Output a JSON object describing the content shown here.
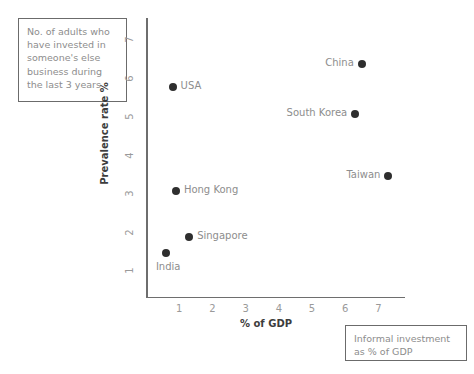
{
  "callouts": {
    "prevalence": "No. of adults who have invested in someone's else business during the last 3 years",
    "gdp": "Informal investment as % of GDP"
  },
  "colors": {
    "point": "#2e2e2e",
    "axis": "#6e6e6e",
    "tick_text": "#9a9a9a",
    "axis_title": "#3d3d3d",
    "callout_border": "#6b6b6b",
    "callout_text": "#8d8d8d",
    "background": "#ffffff"
  },
  "chart_data": {
    "type": "scatter",
    "title": "",
    "xlabel": "% of GDP",
    "ylabel": "Prevalence rate %",
    "xlim": [
      0,
      7.8
    ],
    "ylim": [
      0.35,
      7.6
    ],
    "xticks": [
      1,
      2,
      3,
      4,
      5,
      6,
      7
    ],
    "xtick_labels": [
      "1",
      "2",
      "3",
      "4",
      "5",
      "6",
      "7"
    ],
    "yticks": [
      1,
      2,
      3,
      4,
      5,
      6,
      7
    ],
    "ytick_labels": [
      "1",
      "2",
      "3",
      "4",
      "5",
      "6",
      "7"
    ],
    "grid": false,
    "legend": "none",
    "annotations": [
      "No. of adults who have invested in someone's else business during the last 3 years",
      "Informal investment as % of GDP"
    ],
    "points": [
      {
        "label": "China",
        "x": 6.5,
        "y": 6.4,
        "label_position": "left"
      },
      {
        "label": "USA",
        "x": 0.8,
        "y": 5.8,
        "label_position": "right"
      },
      {
        "label": "South Korea",
        "x": 6.3,
        "y": 5.1,
        "label_position": "left"
      },
      {
        "label": "Taiwan",
        "x": 7.3,
        "y": 3.5,
        "label_position": "left"
      },
      {
        "label": "Hong Kong",
        "x": 0.9,
        "y": 3.1,
        "label_position": "right"
      },
      {
        "label": "Singapore",
        "x": 1.3,
        "y": 1.9,
        "label_position": "right"
      },
      {
        "label": "India",
        "x": 0.6,
        "y": 1.5,
        "label_position": "below"
      }
    ]
  }
}
